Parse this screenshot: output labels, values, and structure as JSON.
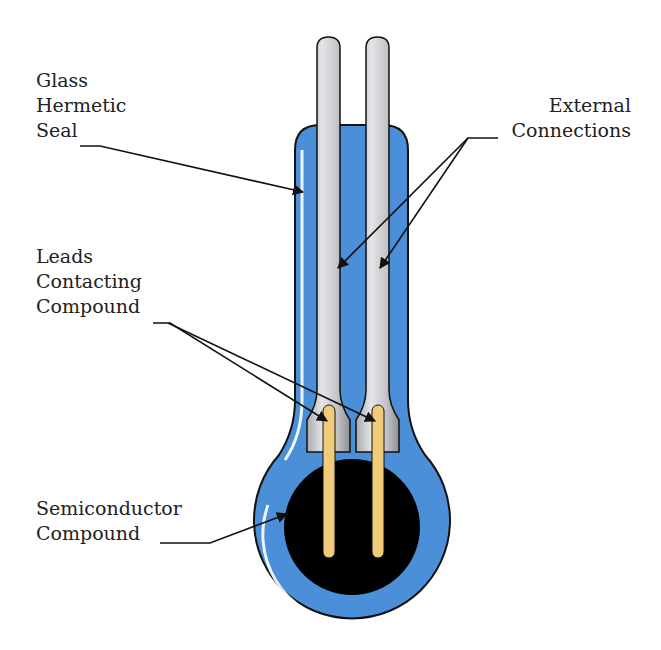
{
  "diagram": {
    "labels": {
      "glass_seal": [
        "Glass",
        "Hermetic",
        "Seal"
      ],
      "external_connections": [
        "External",
        "Connections"
      ],
      "leads_contacting": [
        "Leads",
        "Contacting",
        "Compound"
      ],
      "semiconductor": [
        "Semiconductor",
        "Compound"
      ]
    },
    "colors": {
      "glass": "#4a8fd8",
      "glass_highlight": "#ffffff",
      "pin": "#c4c6c9",
      "pin_shade": "#9a9ca0",
      "lead": "#f0cc7a",
      "compound": "#000000",
      "outline": "#111111",
      "label": "#222222"
    }
  }
}
